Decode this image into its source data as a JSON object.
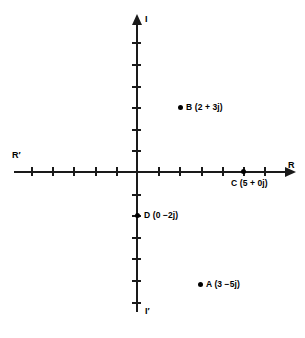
{
  "figure": {
    "type": "argand-diagram",
    "background_color": "#ffffff",
    "line_color": "#1a1a1a"
  },
  "axes": {
    "horizontal": {
      "positive_label": "R",
      "negative_label": "R′",
      "tick_count_negative": 5,
      "tick_count_positive": 6,
      "tick_spacing_px": 21.2
    },
    "vertical": {
      "positive_label": "I",
      "negative_label": "I′",
      "tick_count_positive": 6,
      "tick_count_negative": 6,
      "tick_spacing_px": 21.6
    }
  },
  "points": [
    {
      "id": "B",
      "label": "B (2 + 3j)",
      "real": 2,
      "imag": 3,
      "dot_x": 180,
      "dot_y": 107,
      "label_x": 186,
      "label_y": 102
    },
    {
      "id": "C",
      "label": "C (5 + 0j)",
      "real": 5,
      "imag": 0,
      "dot_x": 243,
      "dot_y": 171,
      "label_x": 231,
      "label_y": 178
    },
    {
      "id": "D",
      "label": "D (0 −2j)",
      "real": 0,
      "imag": -2,
      "dot_x": 137,
      "dot_y": 215,
      "label_x": 144,
      "label_y": 210
    },
    {
      "id": "A",
      "label": "A (3 −5j)",
      "real": 3,
      "imag": -5,
      "dot_x": 200,
      "dot_y": 284,
      "label_x": 206,
      "label_y": 279
    }
  ],
  "chart_data": {
    "type": "scatter",
    "title": "",
    "xlabel": "R",
    "ylabel": "I",
    "xlim": [
      -6,
      7
    ],
    "ylim": [
      -7,
      7
    ],
    "grid": false,
    "legend": "none",
    "series": [
      {
        "name": "complex numbers",
        "points": [
          {
            "name": "B",
            "x": 2,
            "y": 3,
            "annotation": "B (2 + 3j)"
          },
          {
            "name": "C",
            "x": 5,
            "y": 0,
            "annotation": "C (5 + 0j)"
          },
          {
            "name": "D",
            "x": 0,
            "y": -2,
            "annotation": "D (0 −2j)"
          },
          {
            "name": "A",
            "x": 3,
            "y": -5,
            "annotation": "A (3 −5j)"
          }
        ]
      }
    ]
  }
}
